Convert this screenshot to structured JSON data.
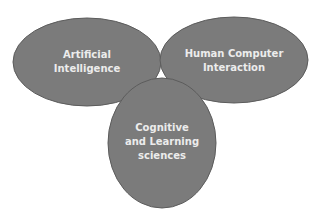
{
  "diagram": {
    "type": "venn",
    "colors": {
      "background": "#ffffff",
      "node_fill": "#7b7b7b",
      "node_stroke": "#5c5c5c",
      "label": "#ececec"
    },
    "nodes": [
      {
        "id": "ai",
        "lines": [
          "Artificial",
          "Intelligence"
        ]
      },
      {
        "id": "hci",
        "lines": [
          "Human Computer",
          "Interaction"
        ]
      },
      {
        "id": "cls",
        "lines": [
          "Cognitive",
          "and Learning",
          "sciences"
        ]
      }
    ]
  }
}
